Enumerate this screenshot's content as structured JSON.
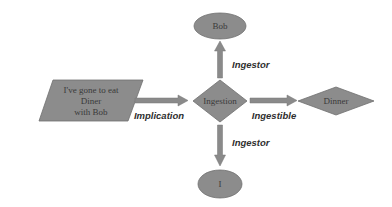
{
  "colors": {
    "shape_fill": "#8c8c8c",
    "shape_stroke": "#6e6e6e",
    "arrow_fill": "#8a8a8a",
    "text": "#333333",
    "background": "#ffffff"
  },
  "nodes": {
    "statement": {
      "shape": "parallelogram",
      "lines": [
        "I've gone to eat",
        "Diner",
        "with Bob"
      ]
    },
    "ingestion": {
      "shape": "diamond",
      "label": "Ingestion"
    },
    "dinner": {
      "shape": "diamond",
      "label": "Dinner"
    },
    "bob": {
      "shape": "ellipse",
      "label": "Bob"
    },
    "i": {
      "shape": "ellipse",
      "label": "I"
    }
  },
  "edges": {
    "implication": {
      "from": "statement",
      "to": "ingestion",
      "label": "Implication"
    },
    "ingestible": {
      "from": "ingestion",
      "to": "dinner",
      "label": "Ingestible"
    },
    "ingestor_up": {
      "from": "ingestion",
      "to": "bob",
      "label": "Ingestor"
    },
    "ingestor_down": {
      "from": "ingestion",
      "to": "i",
      "label": "Ingestor"
    }
  }
}
